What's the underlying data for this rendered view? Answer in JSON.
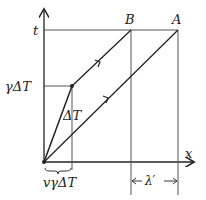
{
  "diagram": {
    "axes": {
      "t_label": "t",
      "x_label": "x"
    },
    "points": {
      "A_label": "A",
      "B_label": "B"
    },
    "labels": {
      "gamma_dt": "γΔT",
      "dt": "ΔT",
      "v_gamma_dt": "vγΔT",
      "lambda_prime": "λ′"
    },
    "colors": {
      "axis": "#222222",
      "line": "#222222",
      "guide": "#555555"
    }
  }
}
